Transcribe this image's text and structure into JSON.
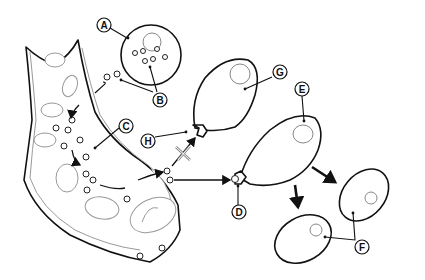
{
  "diagram": {
    "labels": [
      {
        "id": "A",
        "text": "A",
        "target": "cell with granules"
      },
      {
        "id": "B",
        "text": "B",
        "target": "small particles / granules"
      },
      {
        "id": "C",
        "text": "C",
        "target": "blood vessel wall"
      },
      {
        "id": "D",
        "text": "D",
        "target": "receptor bound to particle"
      },
      {
        "id": "E",
        "text": "E",
        "target": "target cell"
      },
      {
        "id": "F",
        "text": "F",
        "target": "daughter cells"
      },
      {
        "id": "G",
        "text": "G",
        "target": "non-responsive cell"
      },
      {
        "id": "H",
        "text": "H",
        "target": "non-matching receptor"
      }
    ],
    "blocked_symbol": "X"
  }
}
